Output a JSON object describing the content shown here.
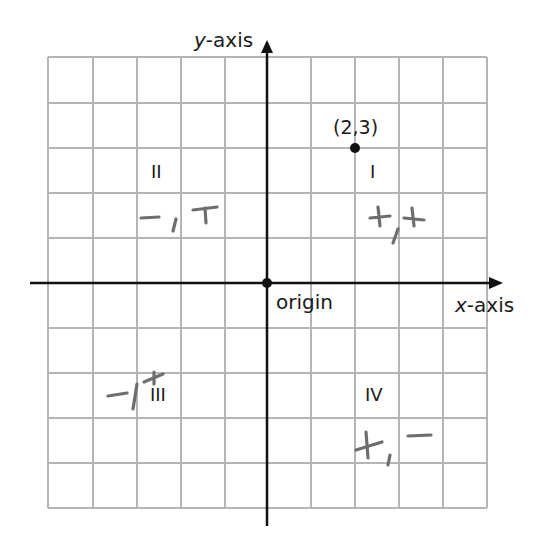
{
  "diagram": {
    "type": "coordinate-plane",
    "grid": {
      "columns": 10,
      "rows": 10,
      "x_range": [
        -5,
        5
      ],
      "y_range": [
        -5,
        5
      ]
    },
    "axes": {
      "x_label_prefix": "x",
      "x_label_suffix": "-axis",
      "y_label_prefix": "y",
      "y_label_suffix": "-axis"
    },
    "origin_label": "origin",
    "point": {
      "label": "(2,3)",
      "x": 2,
      "y": 3
    },
    "quadrants": [
      {
        "id": "I",
        "label": "I",
        "signs": "+,+"
      },
      {
        "id": "II",
        "label": "II",
        "signs": "-,+"
      },
      {
        "id": "III",
        "label": "III",
        "signs": "-,+"
      },
      {
        "id": "IV",
        "label": "IV",
        "signs": "+,-"
      }
    ],
    "colors": {
      "grid": "#b5b5b5",
      "axis": "#111111",
      "handwriting": "#6e6e6e"
    }
  }
}
